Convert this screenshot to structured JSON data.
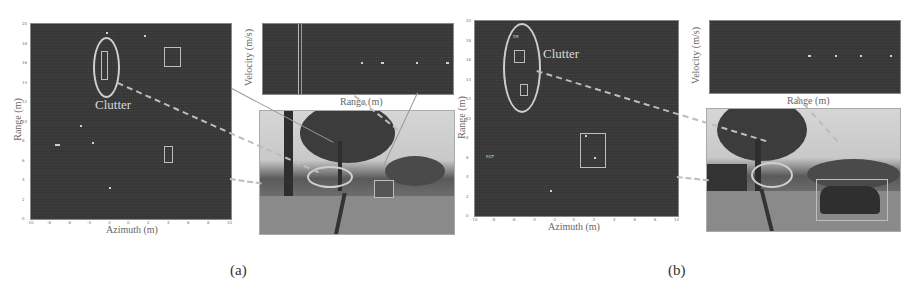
{
  "figure": {
    "panels": [
      {
        "id": "a",
        "caption": "(a)",
        "radar_plot": {
          "xlabel": "Azimuth (m)",
          "ylabel": "Range (m)",
          "x_ticks": [
            "-10",
            "-8",
            "-6",
            "-4",
            "-2",
            "0",
            "2",
            "4",
            "6",
            "8",
            "10"
          ],
          "y_ticks": [
            "20",
            "18",
            "16",
            "14",
            "12",
            "10",
            "8",
            "6",
            "4",
            "2",
            "0"
          ],
          "annotation": "Clutter"
        },
        "velocity_plot": {
          "xlabel": "Range (m)",
          "ylabel": "Velocity (m/s)"
        },
        "camera_image": {
          "description": "street scene with trees, pole and railway track; ellipse marks clutter, box marks target"
        }
      },
      {
        "id": "b",
        "caption": "(b)",
        "radar_plot": {
          "xlabel": "Azimuth (m)",
          "ylabel": "Range (m)",
          "x_ticks": [
            "-10",
            "-8",
            "-6",
            "-4",
            "-2",
            "0",
            "2",
            "4",
            "6",
            "8",
            "10"
          ],
          "y_ticks": [
            "20",
            "18",
            "16",
            "14",
            "12",
            "10",
            "8",
            "6",
            "4",
            "2",
            "0"
          ],
          "annotation": "Clutter"
        },
        "velocity_plot": {
          "xlabel": "Range (m)",
          "ylabel": "Velocity (m/s)"
        },
        "camera_image": {
          "description": "street scene with tree, parked car and railway track; ellipse marks clutter, box marks car"
        }
      }
    ]
  }
}
